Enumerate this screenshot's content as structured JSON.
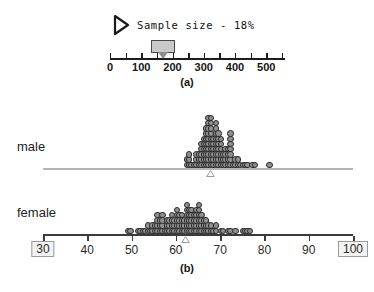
{
  "panel_a": {
    "caption": "(a)",
    "play_icon": "play-triangle-icon",
    "sample_size_label": "Sample size - 18%",
    "slider": {
      "value": 170,
      "min": 0,
      "max": 560,
      "ticks": [
        0,
        50,
        100,
        150,
        200,
        250,
        300,
        350,
        400,
        450,
        500,
        550
      ],
      "tick_labels": [
        {
          "value": 0,
          "text": "0"
        },
        {
          "value": 100,
          "text": "100"
        },
        {
          "value": 200,
          "text": "200"
        },
        {
          "value": 300,
          "text": "300"
        },
        {
          "value": 400,
          "text": "400"
        },
        {
          "value": 500,
          "text": "500"
        }
      ]
    }
  },
  "panel_b": {
    "caption": "(b)",
    "axis": {
      "min": 30,
      "max": 100,
      "ticks": [
        30,
        40,
        50,
        60,
        70,
        80,
        90,
        100
      ],
      "tick_labels": [
        "30",
        "40",
        "50",
        "60",
        "70",
        "80",
        "90",
        "100"
      ],
      "boxed_handles": [
        "30",
        "100"
      ]
    },
    "groups": [
      {
        "label": "male",
        "mean": 67.8
      },
      {
        "label": "female",
        "mean": 62.2
      }
    ]
  },
  "chart_data": {
    "type": "scatter",
    "title": "",
    "xlabel": "",
    "ylabel": "",
    "xlim": [
      30,
      100
    ],
    "grid": false,
    "legend": "none",
    "plots": [
      {
        "name": "sample-size-slider",
        "type": "slider",
        "label": "Sample size - 18%",
        "value": 170,
        "axis_range": [
          0,
          560
        ],
        "tick_values": [
          0,
          100,
          200,
          300,
          400,
          500
        ]
      },
      {
        "name": "male-dotplot",
        "type": "dotplot",
        "group": "male",
        "mean": 67.8,
        "axis_range": [
          30,
          100
        ],
        "values": [
          62.2,
          62.6,
          63.0,
          63.2,
          63.4,
          62.8,
          64.2,
          64.4,
          64.6,
          64.8,
          65.0,
          65.2,
          65.4,
          65.6,
          65.8,
          66.0,
          66.2,
          66.4,
          66.6,
          66.8,
          67.0,
          67.2,
          67.4,
          67.6,
          67.8,
          68.0,
          68.2,
          68.4,
          68.6,
          68.8,
          69.0,
          69.2,
          69.4,
          69.6,
          69.8,
          70.0,
          70.2,
          70.4,
          70.6,
          70.8,
          71.0,
          71.4,
          71.8,
          72.2,
          72.6,
          73.0,
          73.4,
          73.8,
          74.2,
          74.6,
          75.0,
          75.6,
          76.4,
          77.2,
          78.0,
          81.0,
          66.0,
          66.0,
          66.2,
          66.2,
          66.4,
          66.4,
          67.0,
          67.0,
          67.2,
          67.2,
          67.4,
          67.4,
          68.0,
          68.0,
          68.2,
          68.2,
          68.4,
          68.6,
          69.0,
          69.0,
          69.2,
          69.4,
          70.0,
          70.2,
          70.4,
          71.0,
          71.2,
          72.0,
          72.2,
          72.4,
          66.6,
          66.8,
          67.6,
          67.8,
          68.8,
          69.6,
          70.6,
          71.6,
          72.6,
          73.2,
          67.0,
          67.6,
          68.0,
          68.4,
          69.0,
          69.8,
          72.0,
          72.4,
          67.2,
          68.2,
          69.2,
          72.2,
          68.6,
          69.4
        ]
      },
      {
        "name": "female-dotplot",
        "type": "dotplot",
        "group": "female",
        "mean": 62.2,
        "axis_range": [
          30,
          100
        ],
        "values": [
          49.4,
          50.0,
          51.6,
          52.0,
          52.4,
          53.0,
          53.4,
          53.8,
          54.2,
          54.6,
          55.0,
          55.4,
          55.8,
          56.2,
          56.6,
          57.0,
          57.4,
          57.8,
          58.2,
          58.6,
          59.0,
          59.4,
          59.8,
          60.2,
          60.6,
          61.0,
          61.4,
          61.8,
          62.2,
          62.6,
          63.0,
          63.4,
          63.8,
          64.2,
          64.6,
          65.0,
          65.4,
          65.8,
          66.2,
          66.6,
          67.0,
          67.4,
          68.0,
          68.6,
          69.2,
          70.0,
          70.8,
          71.6,
          72.6,
          73.4,
          75.0,
          75.6,
          76.2,
          76.6,
          55.2,
          55.6,
          56.0,
          56.4,
          57.2,
          58.0,
          58.4,
          59.2,
          60.0,
          60.4,
          61.2,
          61.6,
          62.0,
          62.4,
          62.8,
          63.2,
          63.6,
          64.0,
          64.4,
          64.8,
          65.2,
          65.6,
          66.0,
          66.4,
          67.2,
          68.2,
          69.0,
          56.0,
          56.8,
          58.4,
          59.6,
          60.8,
          61.4,
          62.0,
          62.6,
          63.0,
          63.8,
          64.6,
          65.4,
          66.0,
          67.0,
          57.0,
          59.8,
          61.0,
          62.2,
          63.4,
          64.2,
          65.0,
          66.2,
          59.0,
          60.2,
          62.4,
          64.0,
          65.2,
          60.0,
          62.8,
          64.4
        ]
      }
    ]
  }
}
